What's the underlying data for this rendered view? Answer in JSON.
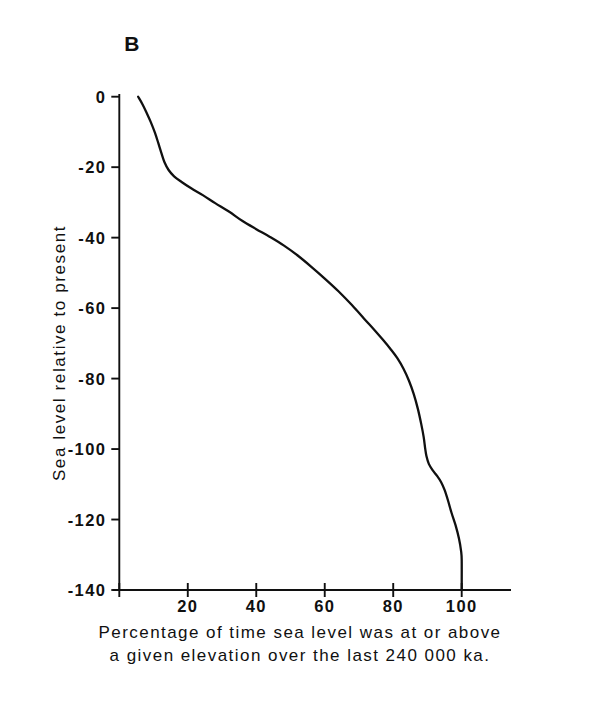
{
  "figure": {
    "panel_letter": "B",
    "background_color": "#ffffff",
    "line_color": "#101010",
    "axis_color": "#101010"
  },
  "chart_data": {
    "type": "line",
    "title": "B",
    "xlabel": "Percentage of time sea level was at or above a given elevation over the last 240 000 ka.",
    "xlabel_lines": [
      "Percentage of time sea level was at or above",
      "a given elevation over the last 240 000 ka."
    ],
    "ylabel": "Sea level relative to present",
    "xlim": [
      0,
      107
    ],
    "ylim": [
      -140,
      0
    ],
    "xticks": [
      20,
      40,
      60,
      80,
      100
    ],
    "xtick_labels": [
      "20",
      "40",
      "60",
      "80",
      "100"
    ],
    "yticks": [
      0,
      -20,
      -40,
      -60,
      -80,
      -100,
      -120,
      -140
    ],
    "ytick_labels": [
      "0",
      "-20",
      "-40",
      "-60",
      "-80",
      "-100",
      "-120",
      "-140"
    ],
    "grid": false,
    "legend": false,
    "series": [
      {
        "name": "cumulative sea level frequency",
        "x": [
          5.5,
          6.8,
          8.0,
          9.2,
          10.4,
          11.4,
          12.3,
          13.2,
          14.4,
          16.0,
          18.2,
          21.0,
          24.5,
          28.0,
          32.0,
          36.0,
          40.0,
          44.0,
          48.0,
          52.0,
          56.0,
          60.0,
          64.0,
          68.0,
          71.5,
          74.5,
          77.0,
          79.2,
          81.2,
          83.0,
          84.6,
          86.0,
          87.2,
          88.2,
          88.9,
          89.3,
          89.7,
          90.4,
          91.5,
          92.8,
          94.0,
          95.0,
          96.0,
          97.0,
          98.2,
          99.2,
          99.8,
          100.0,
          100.0
        ],
        "y": [
          0.0,
          -2.2,
          -4.6,
          -7.2,
          -10.2,
          -13.2,
          -16.0,
          -18.6,
          -20.8,
          -22.6,
          -24.2,
          -26.0,
          -28.0,
          -30.2,
          -32.6,
          -35.3,
          -37.6,
          -39.8,
          -42.2,
          -45.0,
          -48.2,
          -51.6,
          -55.2,
          -59.2,
          -63.0,
          -66.2,
          -69.0,
          -71.6,
          -74.2,
          -77.2,
          -80.6,
          -84.4,
          -88.6,
          -93.0,
          -96.6,
          -99.6,
          -102.0,
          -104.2,
          -106.0,
          -107.6,
          -109.4,
          -111.6,
          -114.6,
          -118.0,
          -121.6,
          -125.4,
          -128.8,
          -131.5,
          -140.0
        ]
      }
    ]
  },
  "axes_geometry": {
    "x_pixel_at_0": 119.3,
    "x_pixel_at_100": 461.7,
    "y_pixel_at_0": 96.7,
    "y_pixel_at_minus140": 590.0,
    "x_axis_right_end": 511.0
  }
}
